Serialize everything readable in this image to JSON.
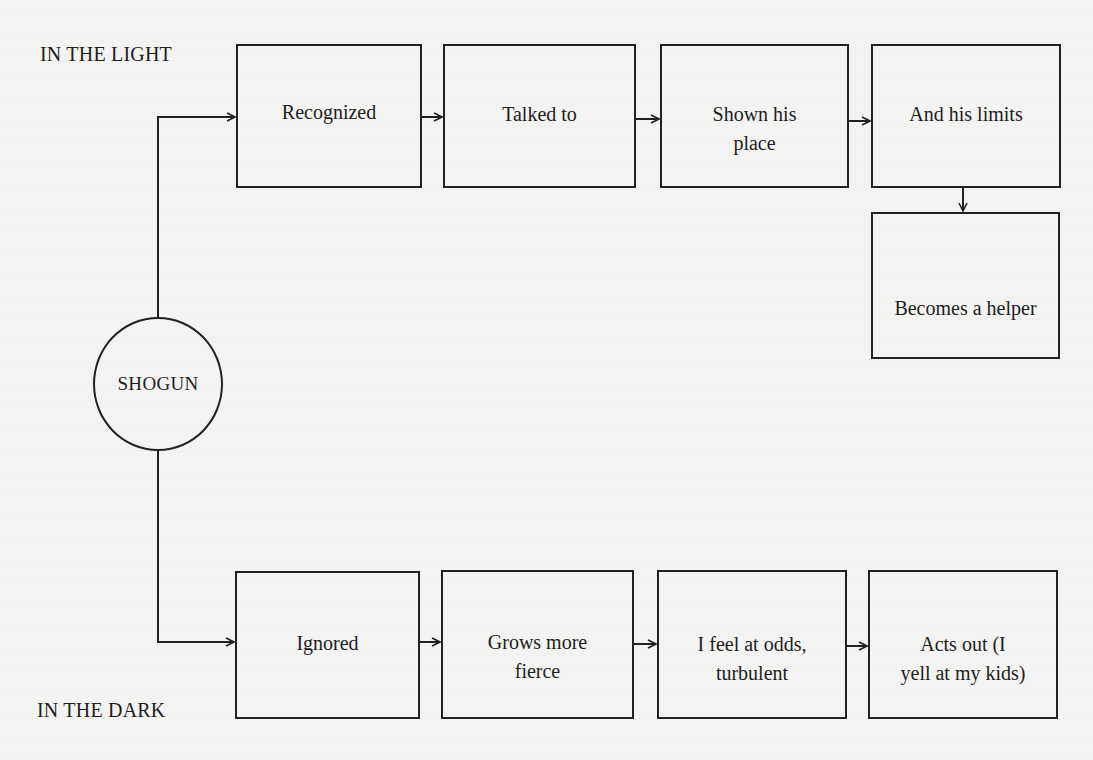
{
  "diagram": {
    "center_node": {
      "id": "shogun",
      "label": "SHOGUN",
      "shape": "circle"
    },
    "section_labels": {
      "top": "IN THE LIGHT",
      "bottom": "IN THE DARK"
    },
    "light_path": [
      {
        "id": "recognized",
        "line1": "Recognized",
        "line2": ""
      },
      {
        "id": "talked-to",
        "line1": "Talked to",
        "line2": ""
      },
      {
        "id": "shown-his-place",
        "line1": "Shown his",
        "line2": "place"
      },
      {
        "id": "and-his-limits",
        "line1": "And his limits",
        "line2": ""
      },
      {
        "id": "becomes-a-helper",
        "line1": "Becomes a helper",
        "line2": ""
      }
    ],
    "dark_path": [
      {
        "id": "ignored",
        "line1": "Ignored",
        "line2": ""
      },
      {
        "id": "grows-more-fierce",
        "line1": "Grows more",
        "line2": "fierce"
      },
      {
        "id": "feel-at-odds",
        "line1": "I feel at odds,",
        "line2": "turbulent"
      },
      {
        "id": "acts-out",
        "line1": "Acts out (I",
        "line2": "yell at my kids)"
      }
    ],
    "edges": [
      [
        "shogun",
        "recognized"
      ],
      [
        "recognized",
        "talked-to"
      ],
      [
        "talked-to",
        "shown-his-place"
      ],
      [
        "shown-his-place",
        "and-his-limits"
      ],
      [
        "and-his-limits",
        "becomes-a-helper"
      ],
      [
        "shogun",
        "ignored"
      ],
      [
        "ignored",
        "grows-more-fierce"
      ],
      [
        "grows-more-fierce",
        "feel-at-odds"
      ],
      [
        "feel-at-odds",
        "acts-out"
      ]
    ],
    "colors": {
      "background": "#f3f3f1",
      "ink": "#222222"
    }
  }
}
